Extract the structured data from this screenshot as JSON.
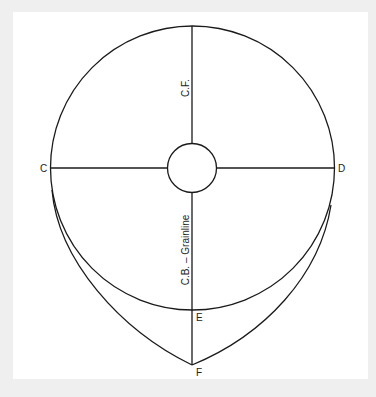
{
  "diagram": {
    "labels": {
      "point_c": "C",
      "point_d": "D",
      "point_e": "E",
      "point_f": "F",
      "center_front": "C.F.",
      "center_back": "C.B. – Grainline"
    },
    "colors": {
      "background": "#efefef",
      "panel": "#ffffff",
      "line": "#1a1a1a"
    }
  }
}
